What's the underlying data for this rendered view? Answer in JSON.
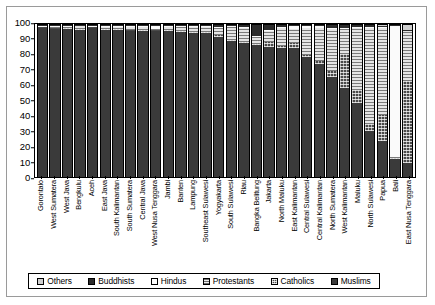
{
  "chart_data": {
    "type": "bar",
    "subtype": "stacked-bar-100",
    "title": "",
    "xlabel": "",
    "ylabel": "",
    "ylim": [
      0,
      100
    ],
    "yticks": [
      0,
      10,
      20,
      30,
      40,
      50,
      60,
      70,
      80,
      90,
      100
    ],
    "grid": false,
    "legend_position": "bottom",
    "stack_order_bottom_to_top": [
      "Muslims",
      "Catholics",
      "Protestants",
      "Hindus",
      "Buddhists",
      "Others"
    ],
    "categories": [
      "Gorontalo",
      "West Sumatera",
      "West Java",
      "Bengkulu",
      "Aceh",
      "East Java",
      "South Kalimantan",
      "South Sumatera",
      "Central Java",
      "West Nusa Tenggara",
      "Jambi",
      "Banten",
      "Lampung",
      "Southeast Sulawesi",
      "Yogyakarta",
      "South Sulawesi",
      "Riau",
      "Bangka Belitung",
      "Jakarta",
      "North Maluku",
      "East Kalimantan",
      "Central Sulawesi",
      "Central Kalimantan",
      "North Sumatera",
      "West Kalimantan",
      "Maluku",
      "North Sulawesi",
      "Papua",
      "Bali",
      "East Nusa Tenggara"
    ],
    "series": [
      {
        "name": "Muslims",
        "color": "#3a3a3a",
        "pattern": "solid-dark",
        "values": [
          98.5,
          98.0,
          97.5,
          97.0,
          98.5,
          96.5,
          97.0,
          96.5,
          96.0,
          96.5,
          96.0,
          95.5,
          95.0,
          95.0,
          92.0,
          89.5,
          88.0,
          86.5,
          85.5,
          85.0,
          85.0,
          79.0,
          74.5,
          66.0,
          58.5,
          49.0,
          30.5,
          23.5,
          12.0,
          9.0
        ]
      },
      {
        "name": "Catholics",
        "color": "#4a4a4a",
        "pattern": "crosshatch",
        "values": [
          0.4,
          0.3,
          0.4,
          0.4,
          0.2,
          0.7,
          0.3,
          0.4,
          1.0,
          0.3,
          0.5,
          0.6,
          0.4,
          0.6,
          1.5,
          0.8,
          1.0,
          1.3,
          3.0,
          1.0,
          3.0,
          1.5,
          2.0,
          4.0,
          22.5,
          8.0,
          4.5,
          17.0,
          0.5,
          54.0
        ]
      },
      {
        "name": "Protestants",
        "color": "#d9d9d9",
        "pattern": "horizontal-lines",
        "values": [
          0.5,
          1.0,
          1.3,
          2.0,
          0.6,
          1.5,
          1.5,
          2.0,
          1.8,
          0.4,
          2.5,
          2.6,
          3.5,
          3.6,
          4.5,
          8.5,
          9.5,
          4.5,
          8.0,
          12.5,
          9.5,
          17.5,
          21.5,
          28.0,
          17.0,
          41.5,
          63.5,
          57.5,
          0.5,
          33.5
        ]
      },
      {
        "name": "Hindus",
        "color": "#fafafa",
        "pattern": "white",
        "values": [
          0.1,
          0.2,
          0.3,
          0.3,
          0.1,
          0.5,
          0.3,
          0.3,
          0.4,
          2.5,
          0.3,
          0.5,
          0.6,
          0.4,
          1.0,
          0.8,
          0.2,
          0.2,
          0.5,
          0.3,
          1.8,
          1.5,
          1.5,
          0.2,
          0.3,
          0.3,
          0.5,
          0.8,
          86.5,
          0.2
        ]
      },
      {
        "name": "Buddhists",
        "color": "#2b2b2b",
        "pattern": "solid-black",
        "values": [
          0.3,
          0.3,
          0.4,
          0.2,
          0.5,
          0.6,
          0.7,
          0.6,
          0.6,
          0.2,
          0.5,
          0.6,
          0.4,
          0.3,
          0.8,
          0.3,
          1.2,
          7.3,
          2.8,
          0.9,
          0.5,
          0.4,
          0.4,
          1.6,
          1.5,
          0.9,
          0.8,
          0.7,
          0.4,
          0.3
        ]
      },
      {
        "name": "Others",
        "color": "#cfcfcf",
        "pattern": "light-grey",
        "values": [
          0.2,
          0.2,
          0.1,
          0.1,
          0.1,
          0.2,
          0.2,
          0.2,
          0.2,
          0.1,
          0.2,
          0.2,
          0.1,
          0.1,
          0.2,
          0.1,
          0.1,
          0.2,
          0.2,
          0.3,
          0.2,
          0.1,
          0.1,
          0.2,
          0.2,
          0.3,
          0.2,
          0.5,
          0.1,
          3.0
        ]
      }
    ],
    "legend": [
      {
        "label": "Others",
        "key": "others"
      },
      {
        "label": "Buddhists",
        "key": "buddhists"
      },
      {
        "label": "Hindus",
        "key": "hindus"
      },
      {
        "label": "Protestants",
        "key": "protestants"
      },
      {
        "label": "Catholics",
        "key": "catholics"
      },
      {
        "label": "Muslims",
        "key": "muslims"
      }
    ]
  }
}
